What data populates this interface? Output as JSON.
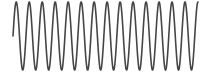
{
  "chart_data": {
    "type": "line",
    "title": "",
    "xlabel": "",
    "ylabel": "",
    "grid": false,
    "legend": null,
    "axes_visible": false,
    "series": [
      {
        "name": "sine wave",
        "function": "sin",
        "cycles": 14.25,
        "amplitude": 1,
        "phase_start": 0,
        "color": "#454545",
        "line_width": 1.6
      }
    ],
    "layout": {
      "x_start_px": 13,
      "x_end_px": 198,
      "center_y_px": 36,
      "amplitude_px": 34
    },
    "ylim": [
      -1,
      1
    ]
  }
}
